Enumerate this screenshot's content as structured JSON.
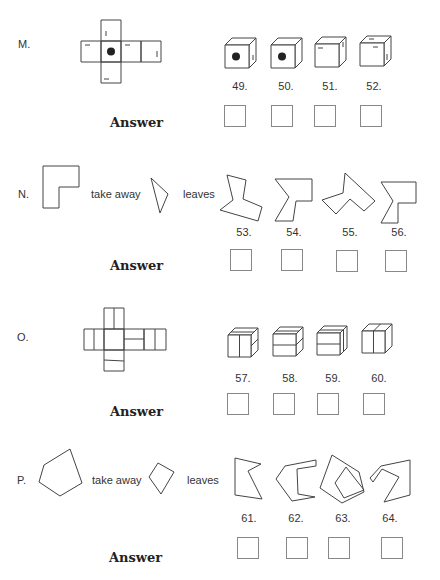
{
  "answer_label": "Answer",
  "questions": [
    {
      "label": "M.",
      "type": "cube-net",
      "options": [
        {
          "number": "49.",
          "icon": "cube-with-dot-icon"
        },
        {
          "number": "50.",
          "icon": "cube-with-dot-icon"
        },
        {
          "number": "51.",
          "icon": "cube-with-marks-icon"
        },
        {
          "number": "52.",
          "icon": "cube-with-marks-icon"
        }
      ]
    },
    {
      "label": "N.",
      "type": "take-away",
      "take_away_text": "take away",
      "leaves_text": "leaves",
      "options": [
        {
          "number": "53.",
          "icon": "polygon-icon"
        },
        {
          "number": "54.",
          "icon": "polygon-icon"
        },
        {
          "number": "55.",
          "icon": "polygon-icon"
        },
        {
          "number": "56.",
          "icon": "polygon-icon"
        }
      ]
    },
    {
      "label": "O.",
      "type": "cube-net",
      "options": [
        {
          "number": "57.",
          "icon": "striped-cube-icon"
        },
        {
          "number": "58.",
          "icon": "striped-cube-icon"
        },
        {
          "number": "59.",
          "icon": "striped-cube-icon"
        },
        {
          "number": "60.",
          "icon": "striped-cube-icon"
        }
      ]
    },
    {
      "label": "P.",
      "type": "take-away",
      "take_away_text": "take away",
      "leaves_text": "leaves",
      "options": [
        {
          "number": "61.",
          "icon": "polygon-icon"
        },
        {
          "number": "62.",
          "icon": "polygon-icon"
        },
        {
          "number": "63.",
          "icon": "polygon-icon"
        },
        {
          "number": "64.",
          "icon": "polygon-icon"
        }
      ]
    }
  ]
}
